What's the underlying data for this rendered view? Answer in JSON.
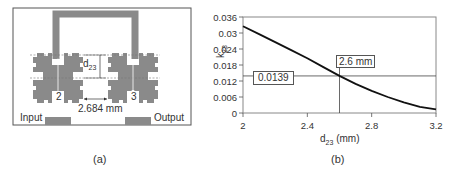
{
  "panel_a": {
    "caption": "(a)",
    "labels": {
      "input": "Input",
      "output": "Output",
      "distance": "2.684 mm",
      "d_main": "d",
      "d_sub": "23",
      "port2": "2",
      "port3": "3"
    },
    "colors": {
      "metal": "#8a8a8a",
      "frame": "#555555"
    }
  },
  "panel_b": {
    "caption": "(b)",
    "annotations": {
      "k_value": "0.0139",
      "d_value": "2.6 mm"
    }
  },
  "chart_data": {
    "type": "line",
    "title": "",
    "xlabel": "d23 (mm)",
    "xlabel_main": "d",
    "xlabel_sub": "23",
    "xlabel_unit": " (mm)",
    "ylabel": "k23",
    "ylabel_main": "k",
    "ylabel_sub": "23",
    "xlim": [
      2,
      3.2
    ],
    "ylim": [
      0,
      0.036
    ],
    "x_ticks": [
      "2",
      "2.4",
      "2.8",
      "3.2"
    ],
    "y_ticks": [
      "0",
      "0.006",
      "0.012",
      "0.018",
      "0.024",
      "0.03",
      "0.036"
    ],
    "grid": false,
    "legend": null,
    "series": [
      {
        "name": "k23 vs d23",
        "x": [
          2.0,
          2.1,
          2.2,
          2.3,
          2.4,
          2.5,
          2.6,
          2.7,
          2.8,
          2.9,
          3.0,
          3.1,
          3.2
        ],
        "values": [
          0.0325,
          0.0296,
          0.0266,
          0.0236,
          0.0205,
          0.0172,
          0.0139,
          0.0109,
          0.0083,
          0.006,
          0.004,
          0.0023,
          0.0014
        ]
      }
    ],
    "reference_lines": {
      "x": 2.6,
      "y": 0.0139
    },
    "annotations": [
      "0.0139",
      "2.6 mm"
    ]
  }
}
